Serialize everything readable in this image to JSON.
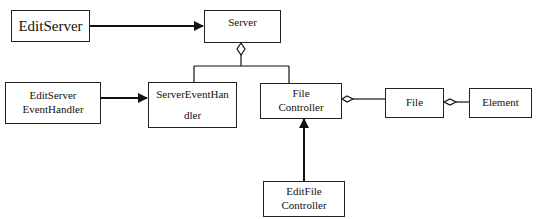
{
  "diagram": {
    "type": "uml-class-diagram",
    "nodes": {
      "edit_server": {
        "label": "EditServer"
      },
      "server": {
        "label": "Server"
      },
      "edit_server_event_handler": {
        "line1": "EditServer",
        "line2": "EventHandler"
      },
      "server_event_handler": {
        "line1": "ServerEventHan",
        "line2": "dler"
      },
      "file_controller": {
        "line1": "File",
        "line2": "Controller"
      },
      "file": {
        "label": "File"
      },
      "element": {
        "label": "Element"
      },
      "edit_file_controller": {
        "line1": "EditFile",
        "line2": "Controller"
      }
    },
    "edges": [
      {
        "from": "EditServer",
        "to": "Server",
        "kind": "association-arrow"
      },
      {
        "from": "Server",
        "to": "ServerEventHandler",
        "kind": "aggregation"
      },
      {
        "from": "Server",
        "to": "FileController",
        "kind": "aggregation"
      },
      {
        "from": "EditServerEventHandler",
        "to": "ServerEventHandler",
        "kind": "association-arrow"
      },
      {
        "from": "FileController",
        "to": "File",
        "kind": "aggregation"
      },
      {
        "from": "File",
        "to": "Element",
        "kind": "aggregation"
      },
      {
        "from": "EditFileController",
        "to": "FileController",
        "kind": "association-arrow"
      }
    ]
  }
}
